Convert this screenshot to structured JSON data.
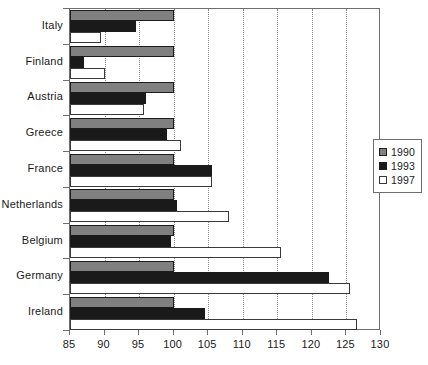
{
  "chart_data": {
    "type": "bar",
    "orientation": "horizontal",
    "title": "",
    "subtitle": "",
    "xlabel": "",
    "ylabel": "",
    "xlim": [
      85,
      130
    ],
    "xticks": [
      85,
      90,
      95,
      100,
      105,
      110,
      115,
      120,
      125,
      130
    ],
    "xtick_labels": [
      "85",
      "90",
      "95",
      "100",
      "105",
      "110",
      "115",
      "120",
      "125",
      "130"
    ],
    "grid": "vertical-dotted",
    "legend_position": "right",
    "categories": [
      "Italy",
      "Finland",
      "Austria",
      "Greece",
      "France",
      "Netherlands",
      "Belgium",
      "Germany",
      "Ireland"
    ],
    "series": [
      {
        "name": "1990",
        "color": "#808080",
        "values": [
          100,
          100,
          100,
          100,
          100,
          100,
          100,
          100,
          100
        ]
      },
      {
        "name": "1993",
        "color": "#1a1a1a",
        "values": [
          94.5,
          87,
          96,
          99,
          105.5,
          100.5,
          99.6,
          122.5,
          104.5
        ]
      },
      {
        "name": "1997",
        "color": "#ffffff",
        "values": [
          89.5,
          90,
          95.7,
          101,
          105.5,
          108,
          115.5,
          125.5,
          126.5
        ]
      }
    ]
  },
  "legend": {
    "entries": [
      {
        "label": "1990",
        "swatch": "legend-swatch-1990"
      },
      {
        "label": "1993",
        "swatch": "legend-swatch-1993"
      },
      {
        "label": "1997",
        "swatch": "legend-swatch-1997"
      }
    ]
  }
}
